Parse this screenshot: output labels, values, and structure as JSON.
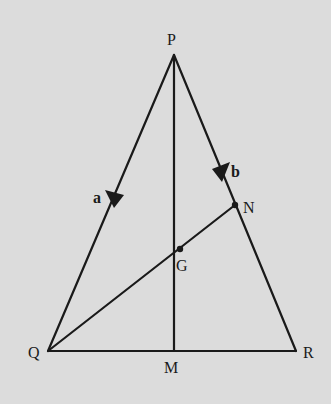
{
  "diagram": {
    "type": "geometry-triangle",
    "background": "#dcdcdc",
    "stroke_color": "#1a1a1a",
    "points": {
      "P": {
        "label": "P",
        "x": 174,
        "y": 55
      },
      "Q": {
        "label": "Q",
        "x": 48,
        "y": 351
      },
      "R": {
        "label": "R",
        "x": 296,
        "y": 351
      },
      "M": {
        "label": "M",
        "x": 174,
        "y": 351
      },
      "N": {
        "label": "N",
        "x": 235,
        "y": 205
      },
      "G": {
        "label": "G",
        "x": 180,
        "y": 249
      }
    },
    "segments": [
      {
        "from": "P",
        "to": "Q"
      },
      {
        "from": "P",
        "to": "R"
      },
      {
        "from": "Q",
        "to": "R"
      },
      {
        "from": "P",
        "to": "M"
      },
      {
        "from": "Q",
        "to": "N"
      }
    ],
    "vectors": {
      "a": {
        "label": "a",
        "on": "PQ",
        "direction": "P to Q"
      },
      "b": {
        "label": "b",
        "on": "PN",
        "direction": "P to N"
      }
    }
  }
}
